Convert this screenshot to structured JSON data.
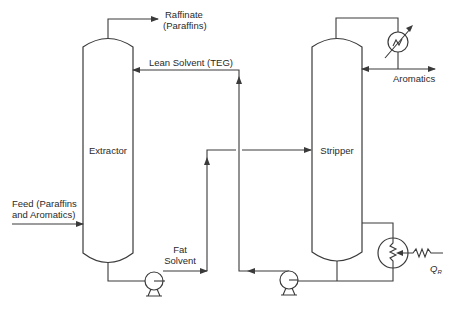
{
  "diagram": {
    "type": "process-flow-diagram",
    "colors": {
      "line": "#3a3a3a",
      "text": "#2a2a2a",
      "background": "#ffffff"
    },
    "units": {
      "extractor": {
        "label": "Extractor"
      },
      "stripper": {
        "label": "Stripper"
      },
      "pump_1": {
        "label": ""
      },
      "pump_2": {
        "label": ""
      },
      "condenser": {
        "label": ""
      },
      "reboiler": {
        "label": ""
      }
    },
    "streams": {
      "raffinate": {
        "line1": "Raffinate",
        "line2": "(Paraffins)"
      },
      "lean_solvent": {
        "label": "Lean Solvent (TEG)"
      },
      "feed": {
        "line1": "Feed (Paraffins",
        "line2": "and Aromatics)"
      },
      "fat_solvent": {
        "line1": "Fat",
        "line2": "Solvent"
      },
      "aromatics": {
        "label": "Aromatics"
      },
      "heat_input": {
        "symbol": "Q",
        "subscript": "R"
      }
    }
  }
}
